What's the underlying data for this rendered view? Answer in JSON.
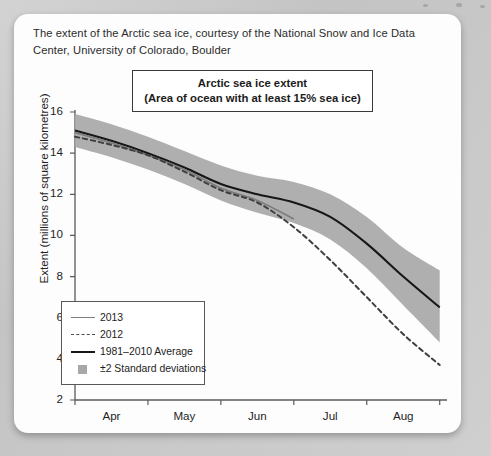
{
  "caption": "The extent of the Arctic sea ice, courtesy of the National Snow and Ice Data Center, University of Colorado, Boulder",
  "chart_data": {
    "type": "line",
    "title_line1": "Arctic sea ice extent",
    "title_line2": "(Area of ocean with at least 15% sea ice)",
    "ylabel": "Extent (millions of square kilometres)",
    "xlabel": "",
    "ylim": [
      2,
      16
    ],
    "yticks": [
      2,
      4,
      6,
      8,
      10,
      12,
      14,
      16
    ],
    "ytick_labels": [
      "2",
      "4",
      "6",
      "8",
      "10",
      "12",
      "14",
      "16"
    ],
    "xtick_labels": [
      "Apr",
      "May",
      "Jun",
      "Jul",
      "Aug"
    ],
    "xticks_month_edges": [
      "Apr 1",
      "May 1",
      "Jun 1",
      "Jul 1",
      "Aug 1",
      "Sep 1"
    ],
    "grid": false,
    "legend_position": "lower left",
    "legend": [
      {
        "label": "2013",
        "style": "solid",
        "color": "#7d7d7d"
      },
      {
        "label": "2012",
        "style": "dashed",
        "color": "#4a4a4a"
      },
      {
        "label": "1981–2010 Average",
        "style": "solid",
        "color": "#171717"
      },
      {
        "label": "±2 Standard deviations",
        "style": "band",
        "color": "#a8a8a8"
      }
    ],
    "x": [
      0,
      0.5,
      1,
      1.5,
      2,
      2.5,
      3,
      3.5,
      4,
      4.5,
      5
    ],
    "x_units": "months from Apr 1 (tick spacing = 1 month)",
    "series": [
      {
        "name": "1981–2010 Average",
        "color": "#171717",
        "style": "solid",
        "values": [
          15.1,
          14.6,
          14.0,
          13.3,
          12.5,
          12.0,
          11.6,
          10.9,
          9.6,
          8.0,
          6.5
        ]
      },
      {
        "name": "2013",
        "color": "#7d7d7d",
        "style": "solid",
        "truncated_at_x": 2.95,
        "values": [
          15.0,
          14.5,
          13.9,
          13.2,
          12.3,
          11.7,
          10.8,
          null,
          null,
          null,
          null
        ]
      },
      {
        "name": "2012",
        "color": "#4a4a4a",
        "style": "dashed",
        "values": [
          14.8,
          14.4,
          13.9,
          13.1,
          12.2,
          11.6,
          10.4,
          8.8,
          7.0,
          5.2,
          3.7
        ]
      }
    ],
    "band": {
      "name": "±2 Standard deviations",
      "color": "#a8a8a8",
      "upper": [
        15.9,
        15.4,
        14.8,
        14.1,
        13.4,
        12.9,
        12.6,
        12.0,
        10.9,
        9.4,
        8.3
      ],
      "lower": [
        14.3,
        13.8,
        13.2,
        12.5,
        11.7,
        11.1,
        10.6,
        9.8,
        8.4,
        6.6,
        4.8
      ]
    }
  }
}
